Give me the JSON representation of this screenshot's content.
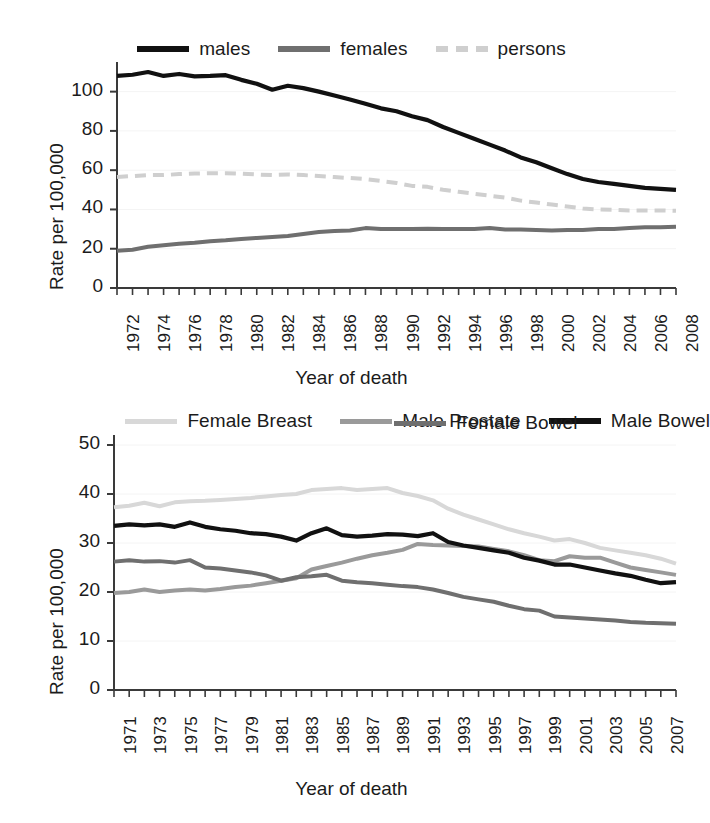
{
  "chart_data": [
    {
      "id": "top",
      "type": "line",
      "title": "",
      "xlabel": "Year of death",
      "ylabel": "Rate per 100,000",
      "ylim": [
        0,
        110
      ],
      "yticks": [
        0,
        20,
        40,
        60,
        80,
        100
      ],
      "xlim": [
        1972,
        2008
      ],
      "xticks": [
        1972,
        1974,
        1976,
        1978,
        1980,
        1982,
        1984,
        1986,
        1988,
        1990,
        1992,
        1994,
        1996,
        1998,
        2000,
        2002,
        2004,
        2006,
        2008
      ],
      "grid": false,
      "legend_position": "top",
      "x": [
        1972,
        1973,
        1974,
        1975,
        1976,
        1977,
        1978,
        1979,
        1980,
        1981,
        1982,
        1983,
        1984,
        1985,
        1986,
        1987,
        1988,
        1989,
        1990,
        1991,
        1992,
        1993,
        1994,
        1995,
        1996,
        1997,
        1998,
        1999,
        2000,
        2001,
        2002,
        2003,
        2004,
        2005,
        2006,
        2007,
        2008
      ],
      "series": [
        {
          "name": "males",
          "color": "#111111",
          "style": "solid",
          "values": [
            108.0,
            108.6,
            110.0,
            108.0,
            109.0,
            107.8,
            108.0,
            108.4,
            106.0,
            104.0,
            101.0,
            103.0,
            101.8,
            100.0,
            98.0,
            96.0,
            93.8,
            91.5,
            90.0,
            87.5,
            85.5,
            82.0,
            79.0,
            76.0,
            73.0,
            70.0,
            66.5,
            64.0,
            61.0,
            58.0,
            55.5,
            54.0,
            53.0,
            52.0,
            51.0,
            50.5,
            50.0
          ]
        },
        {
          "name": "females",
          "color": "#6f6f6f",
          "style": "solid",
          "values": [
            19.0,
            19.5,
            21.0,
            21.8,
            22.5,
            23.0,
            23.8,
            24.3,
            25.0,
            25.5,
            26.0,
            26.5,
            27.5,
            28.5,
            29.0,
            29.3,
            30.5,
            30.0,
            30.0,
            30.0,
            30.2,
            30.0,
            30.0,
            30.0,
            30.5,
            29.8,
            29.8,
            29.5,
            29.3,
            29.5,
            29.5,
            30.0,
            30.0,
            30.5,
            31.0,
            31.0,
            31.2
          ]
        },
        {
          "name": "persons",
          "color": "#cfcfcf",
          "style": "dashed",
          "values": [
            56.5,
            57.0,
            57.5,
            57.5,
            58.0,
            58.3,
            58.5,
            58.5,
            58.2,
            57.8,
            57.5,
            57.8,
            57.5,
            57.0,
            56.5,
            56.0,
            55.5,
            54.5,
            53.5,
            52.0,
            51.5,
            50.0,
            49.0,
            48.0,
            47.0,
            46.0,
            44.5,
            43.5,
            42.5,
            41.5,
            40.5,
            40.0,
            39.8,
            39.5,
            39.5,
            39.5,
            39.3
          ]
        }
      ]
    },
    {
      "id": "bottom",
      "type": "line",
      "title": "",
      "xlabel": "Year of death",
      "ylabel": "Rate per 100,000",
      "ylim": [
        0,
        50
      ],
      "yticks": [
        0,
        10,
        20,
        30,
        40,
        50
      ],
      "xlim": [
        1971,
        2008
      ],
      "xticks": [
        1971,
        1973,
        1975,
        1977,
        1979,
        1981,
        1983,
        1985,
        1987,
        1989,
        1991,
        1993,
        1995,
        1997,
        1999,
        2001,
        2003,
        2005,
        2007
      ],
      "grid": false,
      "legend_position": "top",
      "x": [
        1971,
        1972,
        1973,
        1974,
        1975,
        1976,
        1977,
        1978,
        1979,
        1980,
        1981,
        1982,
        1983,
        1984,
        1985,
        1986,
        1987,
        1988,
        1989,
        1990,
        1991,
        1992,
        1993,
        1994,
        1995,
        1996,
        1997,
        1998,
        1999,
        2000,
        2001,
        2002,
        2003,
        2004,
        2005,
        2006,
        2007,
        2008
      ],
      "series": [
        {
          "name": "Female Breast",
          "color": "#d8d8d8",
          "style": "solid",
          "values": [
            37.3,
            37.6,
            38.2,
            37.5,
            38.3,
            38.5,
            38.6,
            38.8,
            39.0,
            39.2,
            39.5,
            39.8,
            40.0,
            40.8,
            41.0,
            41.2,
            40.8,
            41.0,
            41.2,
            40.2,
            39.6,
            38.7,
            37.0,
            35.8,
            34.8,
            33.8,
            32.8,
            32.0,
            31.3,
            30.5,
            30.8,
            30.0,
            29.0,
            28.5,
            28.0,
            27.5,
            26.8,
            25.8
          ]
        },
        {
          "name": "Male Prostate",
          "color": "#9a9a9a",
          "style": "solid",
          "values": [
            19.8,
            20.0,
            20.5,
            20.0,
            20.3,
            20.5,
            20.3,
            20.6,
            21.0,
            21.3,
            21.8,
            22.3,
            22.8,
            24.6,
            25.3,
            26.0,
            26.8,
            27.5,
            28.0,
            28.6,
            29.8,
            29.6,
            29.5,
            29.4,
            29.3,
            28.8,
            28.3,
            27.5,
            26.5,
            26.3,
            27.3,
            27.0,
            27.0,
            26.0,
            25.0,
            24.5,
            24.0,
            23.5
          ]
        },
        {
          "name": "Male Bowel",
          "color": "#111111",
          "style": "solid",
          "values": [
            33.5,
            33.8,
            33.6,
            33.8,
            33.3,
            34.2,
            33.3,
            32.8,
            32.5,
            32.0,
            31.8,
            31.3,
            30.5,
            32.0,
            33.0,
            31.6,
            31.3,
            31.5,
            31.8,
            31.7,
            31.4,
            32.0,
            30.2,
            29.5,
            29.0,
            28.5,
            28.0,
            27.0,
            26.4,
            25.6,
            25.6,
            25.0,
            24.4,
            23.8,
            23.3,
            22.5,
            21.8,
            22.0
          ]
        },
        {
          "name": "Female Bowel",
          "color": "#6f6f6f",
          "style": "solid",
          "values": [
            26.2,
            26.5,
            26.2,
            26.3,
            26.0,
            26.5,
            25.0,
            24.8,
            24.4,
            24.0,
            23.4,
            22.3,
            23.0,
            23.2,
            23.5,
            22.3,
            22.0,
            21.8,
            21.5,
            21.2,
            21.0,
            20.5,
            19.8,
            19.0,
            18.5,
            18.0,
            17.2,
            16.5,
            16.2,
            15.0,
            14.8,
            14.6,
            14.4,
            14.2,
            13.9,
            13.7,
            13.6,
            13.5
          ]
        }
      ]
    }
  ],
  "top_chart": {
    "legend": [
      {
        "label": "males"
      },
      {
        "label": "females"
      },
      {
        "label": "persons"
      }
    ],
    "ylabel": "Rate per 100,000",
    "xlabel": "Year of death",
    "yticks": [
      "100",
      "80",
      "60",
      "40",
      "20",
      "0"
    ],
    "xticks": [
      "1972",
      "1974",
      "1976",
      "1978",
      "1980",
      "1982",
      "1984",
      "1986",
      "1988",
      "1990",
      "1992",
      "1994",
      "1996",
      "1998",
      "2000",
      "2002",
      "2004",
      "2006",
      "2008"
    ]
  },
  "bottom_chart": {
    "legend": [
      {
        "label": "Female Breast"
      },
      {
        "label": "Male Prostate"
      },
      {
        "label": "Male Bowel"
      },
      {
        "label": "Female Bowel"
      }
    ],
    "ylabel": "Rate per 100,000",
    "xlabel": "Year of death",
    "yticks": [
      "50",
      "40",
      "30",
      "20",
      "10",
      "0"
    ],
    "xticks": [
      "1971",
      "1973",
      "1975",
      "1977",
      "1979",
      "1981",
      "1983",
      "1985",
      "1987",
      "1989",
      "1991",
      "1993",
      "1995",
      "1997",
      "1999",
      "2001",
      "2003",
      "2005",
      "2007"
    ]
  },
  "colors": {
    "black": "#111111",
    "mid_gray": "#6f6f6f",
    "light_gray": "#cfcfcf",
    "breast_gray": "#d8d8d8",
    "prostate_gray": "#9a9a9a",
    "axis": "#444444",
    "background": "#ffffff"
  }
}
